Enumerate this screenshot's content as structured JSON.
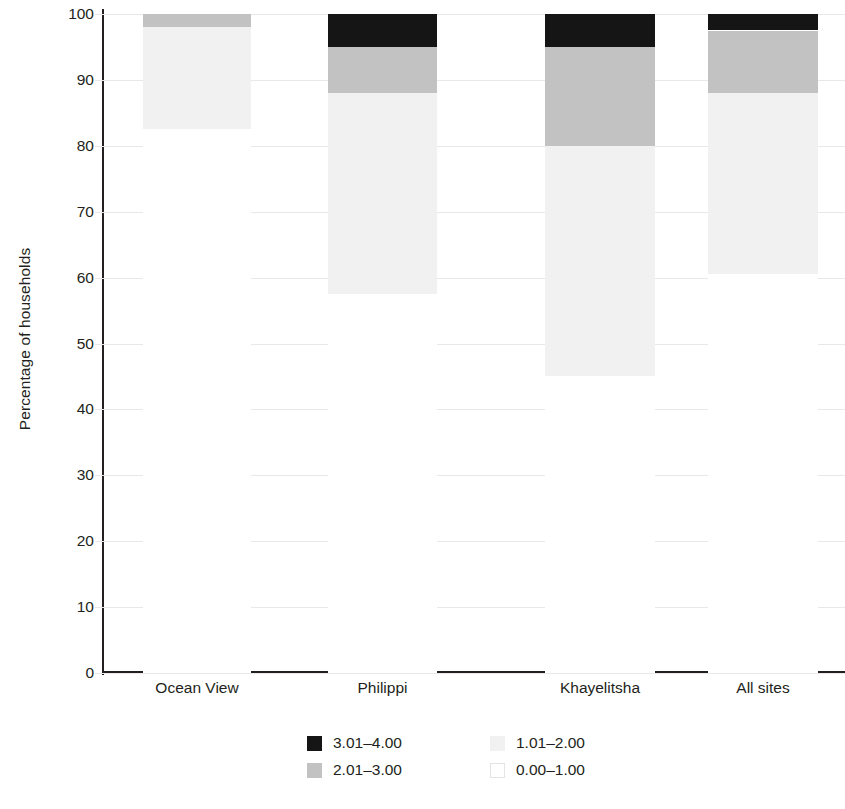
{
  "chart_data": {
    "type": "bar",
    "subtype": "stacked-bar-100",
    "title": "",
    "xlabel": "",
    "ylabel": "Percentage of households",
    "ylim": [
      0,
      100
    ],
    "yticks": [
      0,
      10,
      20,
      30,
      40,
      50,
      60,
      70,
      80,
      90,
      100
    ],
    "ytick_labels": [
      "0",
      "10",
      "20",
      "30",
      "40",
      "50",
      "60",
      "70",
      "80",
      "90",
      "100"
    ],
    "grid": true,
    "grid_axis": "y",
    "legend_position": "bottom",
    "categories": [
      "Ocean View",
      "Philippi",
      "Khayelitsha",
      "All sites"
    ],
    "series": [
      {
        "name": "3.01–4.00",
        "color": "#151515",
        "values": [
          0.0,
          5.0,
          5.0,
          2.5
        ]
      },
      {
        "name": "2.01–3.00",
        "color": "#c2c2c2",
        "values": [
          2.0,
          7.0,
          15.0,
          9.5
        ]
      },
      {
        "name": "1.01–2.00",
        "color": "#f1f1f1",
        "values": [
          15.5,
          30.5,
          35.0,
          27.5
        ]
      },
      {
        "name": "0.00–1.00",
        "color": "#ffffff",
        "values": [
          82.5,
          57.5,
          45.0,
          60.5
        ]
      }
    ],
    "legend_entries": [
      {
        "label": "3.01–4.00",
        "color": "#151515"
      },
      {
        "label": "1.01–2.00",
        "color": "#f1f1f1"
      },
      {
        "label": "2.01–3.00",
        "color": "#c2c2c2"
      },
      {
        "label": "0.00–1.00",
        "color": "#ffffff"
      }
    ]
  },
  "axes": {
    "y_title": "Percentage of households"
  },
  "colors": {
    "text": "#231f20",
    "axis": "#231f20",
    "gridline": "#e9e7ea",
    "background": "#ffffff"
  }
}
